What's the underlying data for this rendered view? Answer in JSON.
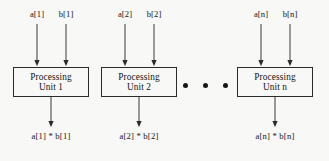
{
  "diagram": {
    "background_color": "#f8f8f6",
    "line_color": "#3a3a3a",
    "box_border_color": "#2b2b2b",
    "units": [
      {
        "id": "unit-1",
        "box_line1": "Processing",
        "box_line2": "Unit 1",
        "input_a_label": "a[1]",
        "input_b_label": "b[1]",
        "output_label": "a[1] * b[1]",
        "box": {
          "x": 13,
          "y": 67,
          "w": 76,
          "h": 30
        },
        "input_a_x": 37,
        "input_b_x": 66,
        "label_y": 14,
        "arrow_top_y": 24,
        "output_x": 51,
        "output_arrow_end_y": 128,
        "output_label_y": 133
      },
      {
        "id": "unit-2",
        "box_line1": "Processing",
        "box_line2": "Unit 2",
        "input_a_label": "a[2]",
        "input_b_label": "b[2]",
        "output_label": "a[2] * b[2]",
        "box": {
          "x": 101,
          "y": 67,
          "w": 76,
          "h": 30
        },
        "input_a_x": 125,
        "input_b_x": 154,
        "label_y": 14,
        "arrow_top_y": 24,
        "output_x": 139,
        "output_arrow_end_y": 128,
        "output_label_y": 133
      },
      {
        "id": "unit-n",
        "box_line1": "Processing",
        "box_line2": "Unit n",
        "input_a_label": "a[n]",
        "input_b_label": "b[n]",
        "output_label": "a[n] * b[n]",
        "box": {
          "x": 237,
          "y": 67,
          "w": 76,
          "h": 30
        },
        "input_a_x": 261,
        "input_b_x": 290,
        "label_y": 14,
        "arrow_top_y": 24,
        "output_x": 275,
        "output_arrow_end_y": 128,
        "output_label_y": 133
      }
    ],
    "ellipsis": {
      "label": "continuation-dots",
      "count": 3,
      "x_positions": [
        185,
        205,
        225
      ],
      "y": 85,
      "dot_diameter": 5
    }
  }
}
